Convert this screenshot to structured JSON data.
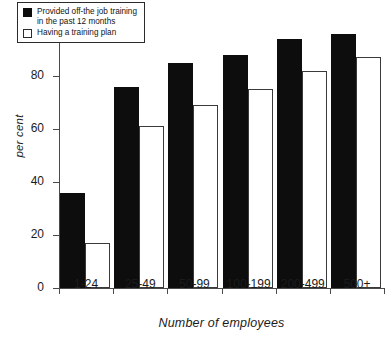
{
  "chart_data": {
    "type": "bar",
    "title": "",
    "subtitle": "",
    "xlabel": "Number of employees",
    "ylabel": "per cent",
    "categories": [
      "1-24",
      "25-49",
      "50-99",
      "100-199",
      "200-499",
      "500+"
    ],
    "series": [
      {
        "name": "Provided off-the job training in the past 12 months",
        "style": "filled-black",
        "values": [
          36,
          76,
          85,
          88,
          94,
          96
        ]
      },
      {
        "name": "Having a training plan",
        "style": "hollow-outline",
        "values": [
          17,
          61,
          69,
          75,
          82,
          87
        ]
      }
    ],
    "ylim": [
      0,
      100
    ],
    "yticks": [
      0,
      20,
      40,
      60,
      80,
      100
    ],
    "ytick_labels": [
      "0",
      "20",
      "40",
      "60",
      "80",
      "100"
    ],
    "grid": false,
    "legend_position": "upper-left-inside"
  },
  "legend": {
    "entries": [
      {
        "swatch": "filled-black-square",
        "label": "Provided off-the job training\nin the past 12 months"
      },
      {
        "swatch": "hollow-white-square",
        "label": "Having a training plan"
      }
    ]
  },
  "colors": {
    "series_one": "#0d0d0d",
    "series_two": "#ffffff",
    "series_two_border": "#3a3a3a",
    "axis": "#4a4a4a",
    "text": "#1b1b1b",
    "background": "#ffffff"
  }
}
